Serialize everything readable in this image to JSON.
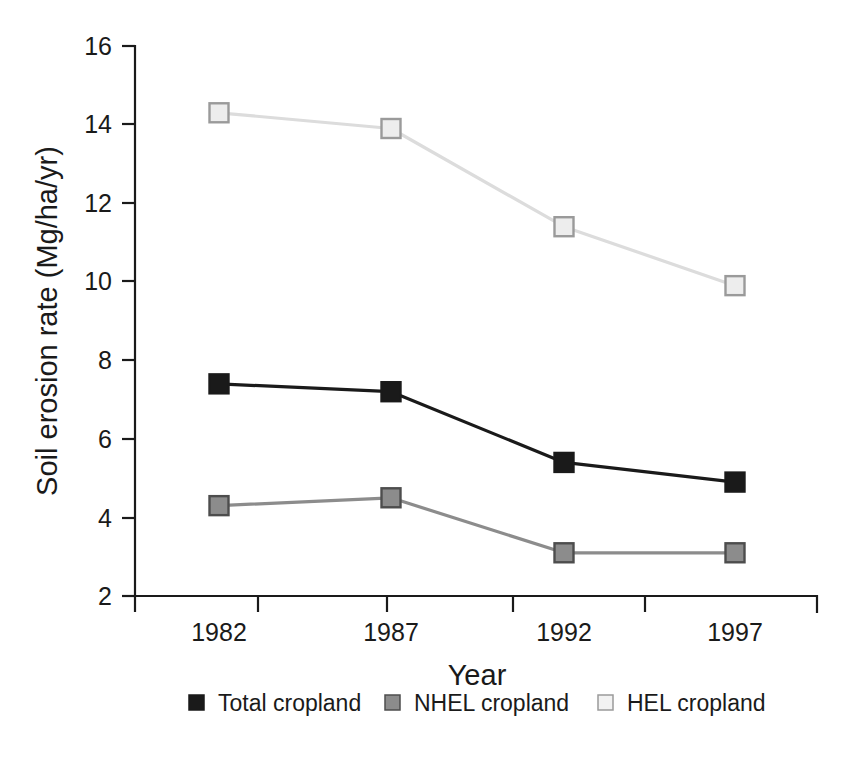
{
  "chart_data": {
    "type": "line",
    "title": "",
    "xlabel": "Year",
    "ylabel": "Soil erosion rate (Mg/ha/yr)",
    "categories": [
      "1982",
      "1987",
      "1992",
      "1997"
    ],
    "x": [
      1982,
      1987,
      1992,
      1997
    ],
    "xtick_labels": [
      "1982",
      "1987",
      "1992",
      "1997"
    ],
    "ytick_labels": [
      "2",
      "4",
      "6",
      "8",
      "10",
      "12",
      "14",
      "16"
    ],
    "yticks": [
      2,
      4,
      6,
      8,
      10,
      12,
      14,
      16
    ],
    "ylim": [
      2,
      16
    ],
    "grid": false,
    "legend_position": "bottom",
    "series": [
      {
        "name": "Total cropland",
        "values": [
          7.4,
          7.2,
          5.4,
          4.9
        ],
        "line_color": "#1a1a1a",
        "marker_fill": "#1a1a1a",
        "marker_edge": "#1a1a1a"
      },
      {
        "name": "NHEL cropland",
        "values": [
          4.3,
          4.5,
          3.1,
          3.1
        ],
        "line_color": "#8c8c8c",
        "marker_fill": "#8c8c8c",
        "marker_edge": "#4d4d4d"
      },
      {
        "name": "HEL cropland",
        "values": [
          14.3,
          13.9,
          11.4,
          9.9
        ],
        "line_color": "#dcdcdc",
        "marker_fill": "#ededed",
        "marker_edge": "#9a9a9a"
      }
    ]
  },
  "legend": {
    "items": [
      {
        "label": "Total cropland"
      },
      {
        "label": "NHEL cropland"
      },
      {
        "label": "HEL cropland"
      }
    ]
  },
  "axes": {
    "y_title": "Soil erosion rate (Mg/ha/yr)",
    "x_title": "Year"
  }
}
